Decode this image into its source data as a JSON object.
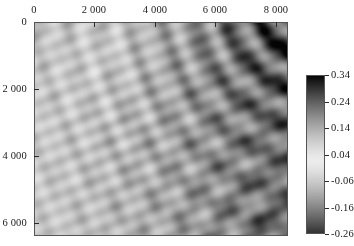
{
  "figure": {
    "background": "#ffffff",
    "type": "pseudocolor-heatmap"
  },
  "chart_data": {
    "type": "heatmap",
    "title": "",
    "xlabel": "",
    "ylabel": "",
    "x_axis_position": "top",
    "y_axis_direction": "inverted",
    "grid": false,
    "xlim": [
      0,
      8400
    ],
    "ylim": [
      6400,
      0
    ],
    "xticks": [
      0,
      2000,
      4000,
      6000,
      8000
    ],
    "xticklabels": [
      "0",
      "2 000",
      "4 000",
      "6 000",
      "8 000"
    ],
    "yticks": [
      0,
      2000,
      4000,
      6000
    ],
    "yticklabels": [
      "0",
      "2 000",
      "4 000",
      "6 000"
    ],
    "zlim": [
      -0.26,
      0.34
    ],
    "colorbar": {
      "position": "right",
      "orientation": "vertical",
      "ticks": [
        0.34,
        0.24,
        0.14,
        0.04,
        -0.06,
        -0.16,
        -0.26
      ],
      "ticklabels": [
        "0.34",
        "0.24",
        "0.14",
        "0.04",
        "-0.06",
        "-0.16",
        "-0.26"
      ],
      "colormap": "cyclic-gray (dark at both extremes, light near 0.02)",
      "vmin": -0.26,
      "vmax": 0.34
    },
    "features": [
      {
        "name": "upper-right-dark-lobe",
        "x_range": [
          5200,
          8400
        ],
        "y_range": [
          0,
          2600
        ],
        "value": 0.33
      },
      {
        "name": "upper-left-fringe-packet",
        "x_range": [
          0,
          900
        ],
        "y_range": [
          0,
          1800
        ],
        "value": 0.22
      },
      {
        "name": "lower-right-dark-lobe",
        "x_range": [
          5600,
          8400
        ],
        "y_range": [
          4600,
          6400
        ],
        "value": 0.3
      },
      {
        "name": "bright-ridge-diagonal",
        "x_range": [
          700,
          4400
        ],
        "y_range": [
          0,
          2400
        ],
        "value": -0.07
      },
      {
        "name": "central-plateau",
        "x_range": [
          600,
          5200
        ],
        "y_range": [
          2200,
          6400
        ],
        "value": 0.05
      }
    ]
  },
  "axes": {
    "x_ticks": [
      {
        "label": "0",
        "value": 0
      },
      {
        "label": "2 000",
        "value": 2000
      },
      {
        "label": "4 000",
        "value": 4000
      },
      {
        "label": "6 000",
        "value": 6000
      },
      {
        "label": "8 000",
        "value": 8000
      }
    ],
    "y_ticks": [
      {
        "label": "0",
        "value": 0
      },
      {
        "label": "2 000",
        "value": 2000
      },
      {
        "label": "4 000",
        "value": 4000
      },
      {
        "label": "6 000",
        "value": 6000
      }
    ]
  },
  "colorbar_ticks": [
    {
      "label": "0.34",
      "value": 0.34
    },
    {
      "label": "0.24",
      "value": 0.24
    },
    {
      "label": "0.14",
      "value": 0.14
    },
    {
      "label": "0.04",
      "value": 0.04
    },
    {
      "label": "-0.06",
      "value": -0.06
    },
    {
      "label": "-0.16",
      "value": -0.16
    },
    {
      "label": "-0.26",
      "value": -0.26
    }
  ]
}
